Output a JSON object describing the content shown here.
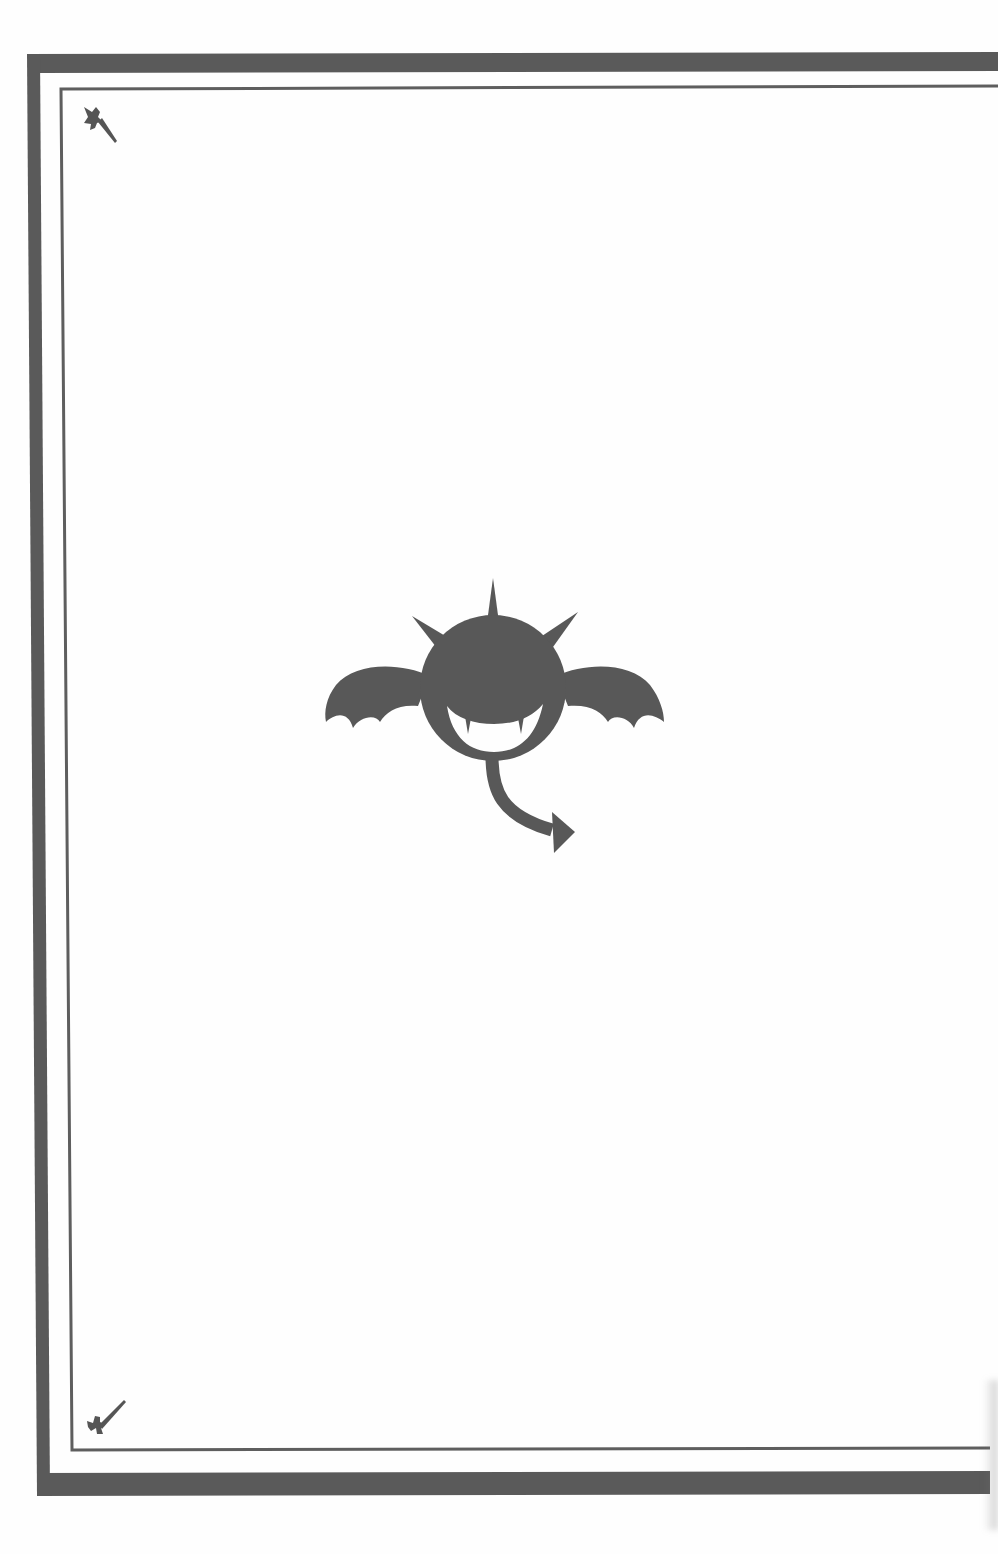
{
  "page": {
    "type": "decorative-book-page",
    "background_color": "#fefefe",
    "ink_color": "#585858"
  },
  "frame": {
    "outer_border": "thick-dark-rule",
    "inner_border": "thin-rule",
    "corner_ornaments": [
      {
        "position": "top-left",
        "icon": "crossed-dagger-icon"
      },
      {
        "position": "bottom-left",
        "icon": "crossed-dagger-icon"
      }
    ]
  },
  "emblem": {
    "icon": "bat-demon-emblem-icon",
    "description": "Round demon head with three spikes, bat wings, fanged grin and arrow-tipped tail"
  }
}
